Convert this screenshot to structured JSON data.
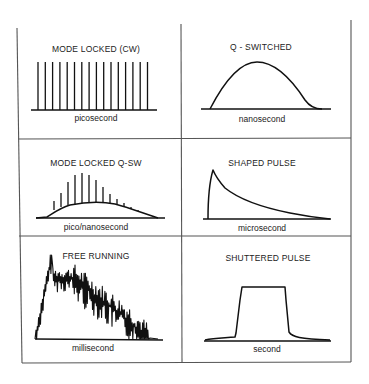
{
  "diagram": {
    "panels": [
      {
        "title": "MODE LOCKED (CW)",
        "timescale": "picosecond",
        "shape": "regular train of narrow equal-height spikes"
      },
      {
        "title": "Q - SWITCHED",
        "timescale": "nanosecond",
        "shape": "single smooth bell-shaped pulse"
      },
      {
        "title": "MODE LOCKED Q-SW",
        "timescale": "pico/nanosecond",
        "shape": "spikes modulated by a Q-switched envelope"
      },
      {
        "title": "SHAPED PULSE",
        "timescale": "microsecond",
        "shape": "fast rise, exponential decay"
      },
      {
        "title": "FREE RUNNING",
        "timescale": "millisecond",
        "shape": "noisy spiking within a broad envelope"
      },
      {
        "title": "SHUTTERED PULSE",
        "timescale": "second",
        "shape": "flat-topped rectangular pulse"
      }
    ]
  }
}
